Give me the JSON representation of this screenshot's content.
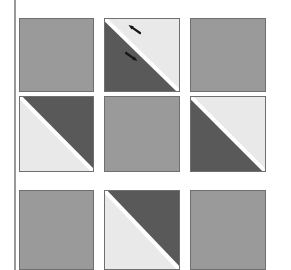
{
  "figure": {
    "width": 291,
    "height": 270,
    "background": "#ffffff"
  },
  "colors": {
    "background": "#ffffff",
    "plain_gray": "#9a9a9a",
    "dark_gray": "#595959",
    "light_gray": "#e9e9e9",
    "tile_border": "#6f6f6f",
    "seam_white": "#ffffff",
    "rule_gray": "#9a9a9a",
    "arrow_black": "#161616"
  },
  "left_rule": {
    "name": "left-vertical-rule",
    "x": 14,
    "width": 2,
    "color": "#9a9a9a"
  },
  "grid": {
    "rows": 3,
    "cols": 3,
    "col_x": [
      19,
      104,
      190
    ],
    "row_y": [
      18,
      96,
      190
    ],
    "tile_width": 75,
    "tile_height": 75,
    "seam_width": 4
  },
  "tiles": [
    {
      "id": "tile-r1c1",
      "row": 1,
      "col": 1,
      "x": 19,
      "y": 18,
      "width": 75,
      "height": 74,
      "style": "plain",
      "fill": "#9a9a9a",
      "diagonal": "none",
      "arrows": []
    },
    {
      "id": "tile-r1c2",
      "row": 1,
      "col": 2,
      "x": 104,
      "y": 18,
      "width": 76,
      "height": 74,
      "style": "split",
      "diagonal": "tl-br",
      "upper_right_fill": "#e9e9e9",
      "lower_left_fill": "#595959",
      "arrows": [
        {
          "name": "arrow-into-light-half",
          "x": 140,
          "y": 33,
          "angle_deg": 215,
          "length": 14,
          "color": "#161616",
          "points_toward": "diagonal-seam"
        },
        {
          "name": "arrow-into-dark-half",
          "x": 126,
          "y": 53,
          "angle_deg": 35,
          "length": 14,
          "color": "#161616",
          "points_toward": "diagonal-seam"
        }
      ]
    },
    {
      "id": "tile-r1c3",
      "row": 1,
      "col": 3,
      "x": 190,
      "y": 18,
      "width": 76,
      "height": 74,
      "style": "plain",
      "fill": "#9a9a9a",
      "diagonal": "none",
      "arrows": []
    },
    {
      "id": "tile-r2c1",
      "row": 2,
      "col": 1,
      "x": 19,
      "y": 96,
      "width": 75,
      "height": 76,
      "style": "split",
      "diagonal": "tl-br",
      "upper_right_fill": "#595959",
      "lower_left_fill": "#e9e9e9",
      "arrows": []
    },
    {
      "id": "tile-r2c2",
      "row": 2,
      "col": 2,
      "x": 104,
      "y": 96,
      "width": 76,
      "height": 76,
      "style": "plain",
      "fill": "#9a9a9a",
      "diagonal": "none",
      "arrows": []
    },
    {
      "id": "tile-r2c3",
      "row": 2,
      "col": 3,
      "x": 190,
      "y": 96,
      "width": 76,
      "height": 76,
      "style": "split",
      "diagonal": "tl-br",
      "upper_right_fill": "#e9e9e9",
      "lower_left_fill": "#595959",
      "arrows": []
    },
    {
      "id": "tile-r3c1",
      "row": 3,
      "col": 1,
      "x": 19,
      "y": 190,
      "width": 75,
      "height": 80,
      "style": "plain",
      "fill": "#9a9a9a",
      "diagonal": "none",
      "arrows": []
    },
    {
      "id": "tile-r3c2",
      "row": 3,
      "col": 2,
      "x": 104,
      "y": 190,
      "width": 76,
      "height": 80,
      "style": "split",
      "diagonal": "tl-br",
      "upper_right_fill": "#595959",
      "lower_left_fill": "#e9e9e9",
      "arrows": []
    },
    {
      "id": "tile-r3c3",
      "row": 3,
      "col": 3,
      "x": 190,
      "y": 190,
      "width": 76,
      "height": 80,
      "style": "plain",
      "fill": "#9a9a9a",
      "diagonal": "none",
      "arrows": []
    }
  ]
}
